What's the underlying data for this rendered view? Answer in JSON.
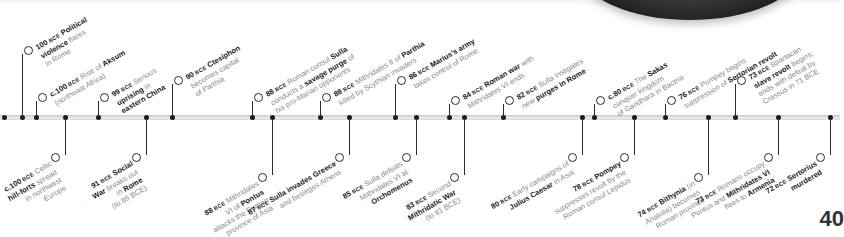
{
  "timeline": {
    "above": [
      {
        "x": 22,
        "year": "100",
        "prefix": "",
        "lines": [
          "[100 BCE] **Political**",
          "**violence** flares",
          "in Rome"
        ],
        "top": 48
      },
      {
        "x": 36,
        "year": "c.100",
        "lines": [
          "[c.100 BCE] Rise of **Aksum**",
          "(northeast Africa)"
        ],
        "top": 95
      },
      {
        "x": 98,
        "year": "99",
        "lines": [
          "[99 BCE] Serious",
          "**uprising** in",
          "**eastern China**"
        ],
        "top": 95
      },
      {
        "x": 172,
        "year": "90",
        "lines": [
          "[90 BCE] **Ctesiphon**",
          "becomes capital",
          "of Parthia"
        ],
        "top": 78
      },
      {
        "x": 252,
        "year": "88",
        "lines": [
          "[88 BCE] Roman consul **Sulla**",
          "conducts a **savage purge** of",
          "his pro-Marian opponents"
        ],
        "top": 95
      },
      {
        "x": 320,
        "year": "88",
        "lines": [
          "[88 BCE] Mithridates II of **Parthia**",
          "killed by Scythian invaders"
        ],
        "top": 95
      },
      {
        "x": 395,
        "year": "86",
        "lines": [
          "[86 BCE] **Marius's army**",
          "takes control of Rome"
        ],
        "top": 78
      },
      {
        "x": 449,
        "year": "84",
        "lines": [
          "[84 BCE] **Roman war** with",
          "Mithridates VI ends"
        ],
        "top": 98
      },
      {
        "x": 503,
        "year": "82",
        "lines": [
          "[82 BCE] Sulla instigates",
          "new **purges in Rome**"
        ],
        "top": 98
      },
      {
        "x": 594,
        "year": "c.80",
        "lines": [
          "[c.80 BCE] The **Sakas**",
          "conquer kingdom",
          "of Gandhara in Bactria"
        ],
        "top": 98
      },
      {
        "x": 665,
        "year": "76",
        "lines": [
          "[76 BCE] Pompey begins",
          "suppression of **Sertorian revolt**"
        ],
        "top": 98
      },
      {
        "x": 735,
        "year": "73",
        "lines": [
          "[73 BCE] Spartacan",
          "**slave revolt** begins;",
          "ends with defeat by",
          "Crassus in 71 BCE"
        ],
        "top": 78
      }
    ],
    "below": [
      {
        "x": 65,
        "year": "c.100",
        "lines": [
          "[c.100 BCE] Celtic",
          "**hill-forts** spread",
          "in northwest",
          "Europe"
        ]
      },
      {
        "x": 146,
        "year": "91",
        "lines": [
          "[91 BCE] **Social**",
          "**War** breaks out",
          "in **Rome**",
          "(to 89 BCE)"
        ]
      },
      {
        "x": 272,
        "year": "88",
        "lines": [
          "[88 BCE] Mithridates",
          "VI of **Pontus**",
          "attacks the Roman",
          "province of Asia"
        ]
      },
      {
        "x": 349,
        "year": "87",
        "lines": [
          "[87 BCE] **Sulla invades Greece**",
          "and besieges Athens"
        ]
      },
      {
        "x": 416,
        "year": "85",
        "lines": [
          "[85 BCE] Sulla defeats",
          "Mithridates VI at",
          "**Orchomenus**"
        ]
      },
      {
        "x": 464,
        "year": "83",
        "lines": [
          "[83 BCE] Second",
          "**Mithridatic War**",
          "(to 81 BCE)"
        ]
      },
      {
        "x": 582,
        "year": "80",
        "lines": [
          "[80 BCE] Early campaigns of",
          "**Julius Caesar** in Asia"
        ]
      },
      {
        "x": 634,
        "year": "78",
        "lines": [
          "[78 BCE] **Pompey**",
          "suppresses revolt by the",
          "Roman consul Lepidus"
        ]
      },
      {
        "x": 708,
        "year": "74",
        "lines": [
          "[74 BCE] **Bithynia** (in",
          "Anatolia) becomes",
          "Roman province"
        ]
      },
      {
        "x": 778,
        "year": "73",
        "lines": [
          "[73 BCE] Romans occupy",
          "Pontus and **Mithridates VI**",
          "flees to **Armenia**"
        ]
      },
      {
        "x": 830,
        "year": "72",
        "lines": [
          "[72 BCE] **Sertorius**",
          "**murdered**"
        ]
      }
    ],
    "events_text": {
      "e100_political": "100 BCE Political violence flares in Rome",
      "e100_aksum": "c.100 BCE Rise of Aksum (northeast Africa)",
      "e99_china": "99 BCE Serious uprising in eastern China",
      "e90_ctesiphon": "90 BCE Ctesiphon becomes capital of Parthia",
      "e88_sulla_purge": "88 BCE Roman consul Sulla conducts a savage purge of his pro-Marian opponents",
      "e88_parthia": "88 BCE Mithridates II of Parthia killed by Scythian invaders",
      "e86_marius": "86 BCE Marius's army takes control of Rome",
      "e84_war_ends": "84 BCE Roman war with Mithridates VI ends",
      "e82_purges": "82 BCE Sulla instigates new purges in Rome",
      "e80_sakas": "c.80 BCE The Sakas conquer kingdom of Gandhara in Bactria",
      "e76_pompey": "76 BCE Pompey begins suppression of Sertorian revolt",
      "e73_spartacus": "73 BCE Spartacan slave revolt begins; ends with defeat by Crassus in 71 BCE",
      "e100_celtic": "c.100 BCE Celtic hill-forts spread in northwest Europe",
      "e91_social": "91 BCE Social War breaks out in Rome (to 89 BCE)",
      "e88_pontus": "88 BCE Mithridates VI of Pontus attacks the Roman province of Asia",
      "e87_greece": "87 BCE Sulla invades Greece and besieges Athens",
      "e85_orchomenus": "85 BCE Sulla defeats Mithridates VI at Orchomenus",
      "e83_second_war": "83 BCE Second Mithridatic War (to 81 BCE)",
      "e80_caesar": "80 BCE Early campaigns of Julius Caesar in Asia",
      "e78_pompey": "78 BCE Pompey suppresses revolt by the Roman consul Lepidus",
      "e74_bithynia": "74 BCE Bithynia (in Anatolia) becomes Roman province",
      "e73_armenia": "73 BCE Romans occupy Pontus and Mithridates VI flees to Armenia",
      "e72_sertorius": "72 BCE Sertorius murdered"
    },
    "bar_dots_x": [
      4,
      36,
      65,
      98,
      146,
      172,
      272,
      252,
      320,
      349,
      395,
      416,
      449,
      464,
      503,
      582,
      594,
      634,
      665,
      708,
      735,
      778,
      830
    ]
  },
  "page": {
    "number": "40"
  },
  "colors": {
    "text_dark": "#1a1a1a",
    "text_muted": "#8a8a8a",
    "bar": "#d6d6d6"
  }
}
